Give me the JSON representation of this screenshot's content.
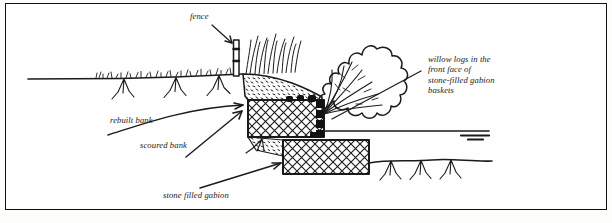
{
  "figure": {
    "kind": "engineering cross-section diagram",
    "border_color": "#111111",
    "ink_color": "#1a1a1a",
    "background": "#fefefe"
  },
  "labels": {
    "fence": "fence",
    "rebuilt_bank": "rebuilt bank",
    "scoured_bank": "scoured bank",
    "stone_filled_gabion": "stone filled gabion",
    "willow_logs": "willow logs in the\nfront face of\nstone-filled gabion\nbaskets"
  },
  "elements": {
    "fence_post": "fence-post",
    "reeds": "reed-vegetation",
    "willow_crown": "willow-shrub-crown",
    "grass_line": "bank-top-grass",
    "roots": "root-tufts",
    "upper_gabion": "upper-gabion-basket",
    "lower_gabion": "lower-gabion-basket",
    "backfill": "stippled-soil-backfill",
    "logs": "willow-log-blocks",
    "water_level": "water-level-symbol",
    "river_bed": "river-bed-line",
    "arrow_rebuilt": "curved-arrow-rebuilt-bank",
    "arrow_scoured": "arrow-scoured-bank",
    "arrow_gabion": "arrow-stone-filled-gabion",
    "leader_willow": "leader-line-willow-logs",
    "leader_fence": "arrow-fence"
  }
}
